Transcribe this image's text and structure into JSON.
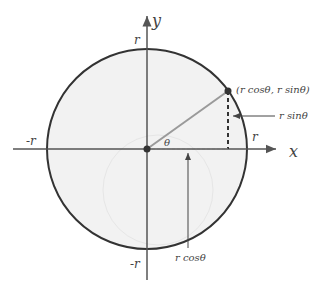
{
  "diagram": {
    "axes": {
      "x_label": "x",
      "y_label": "y"
    },
    "circle_labels": {
      "top": "r",
      "bottom": "-r",
      "left": "-r",
      "right": "r"
    },
    "angle_label": "θ",
    "point_label": "(r cosθ, r sinθ)",
    "sin_label": "r sinθ",
    "cos_label": "r cosθ",
    "colors": {
      "circle_stroke": "#333333",
      "circle_fill": "#f2f2f2",
      "axis": "#555555",
      "radius_line": "#9a9a9a",
      "point": "#333333"
    }
  }
}
